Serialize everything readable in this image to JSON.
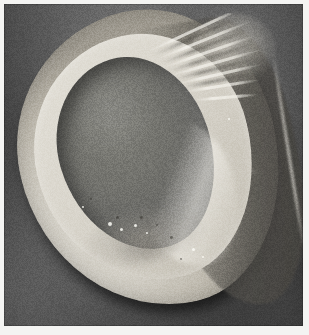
{
  "figure": {
    "domain": "Natural-Image",
    "kind": "grayscale-micrograph",
    "caption": "",
    "width_px": 309,
    "height_px": 335,
    "colorspace": "grayscale",
    "visible_text": [],
    "scale_bar": null,
    "labels": []
  },
  "plate": {
    "margin_px": 4,
    "background_tone": "#4d4d4d",
    "background_description": "mottled dark grey studio backdrop with faint vertical lighting streaks"
  },
  "specimen": {
    "name": "shell-valve",
    "description": "tilted ovate valve shown concave-side-up, bright granular calcareous rim surrounding a darker recessed interior cavity",
    "orientation_deg": -13,
    "regions": [
      {
        "name": "outer-rim",
        "tone": "#cdc9bf",
        "description": "broad bright granular shell margin"
      },
      {
        "name": "inner-cavity",
        "tone": "#6d6d68",
        "description": "dark recessed hollow interior of the valve"
      },
      {
        "name": "posterior-flank",
        "tone": "#5a5854",
        "description": "shadowed right-hand outer surface of the valve"
      },
      {
        "name": "dorsal-ridges",
        "tone": "#e8e5dd",
        "description": "lamellate ridged growth structure at the upper right (umbo region)"
      },
      {
        "name": "ventral-margin",
        "tone": "#d9d6cd",
        "description": "smooth bright lower edge with cast shadow beneath"
      }
    ],
    "accent_colors": {
      "highlight": "#e8e5dd",
      "midtone": "#b9b4a8",
      "shadow": "#3f3f3f",
      "cavity": "#6d6d68"
    }
  },
  "ridges": [
    {
      "left": 6,
      "top": 14,
      "width": 108,
      "rot": -16
    },
    {
      "left": 14,
      "top": 26,
      "width": 104,
      "rot": -13
    },
    {
      "left": 20,
      "top": 38,
      "width": 100,
      "rot": -10
    },
    {
      "left": 26,
      "top": 50,
      "width": 96,
      "rot": -7
    },
    {
      "left": 32,
      "top": 62,
      "width": 88,
      "rot": -4
    },
    {
      "left": 38,
      "top": 74,
      "width": 78,
      "rot": 0
    },
    {
      "left": 46,
      "top": 86,
      "width": 66,
      "rot": 4
    }
  ],
  "ridges_dark": [
    {
      "left": 10,
      "top": 20,
      "width": 104,
      "rot": -15
    },
    {
      "left": 18,
      "top": 32,
      "width": 100,
      "rot": -12
    },
    {
      "left": 24,
      "top": 44,
      "width": 96,
      "rot": -9
    },
    {
      "left": 30,
      "top": 56,
      "width": 90,
      "rot": -5
    },
    {
      "left": 36,
      "top": 68,
      "width": 82,
      "rot": -2
    }
  ],
  "specks": [
    {
      "left": 88,
      "top": 212,
      "size": 4
    },
    {
      "left": 100,
      "top": 218,
      "size": 3
    },
    {
      "left": 114,
      "top": 214,
      "size": 3
    },
    {
      "left": 126,
      "top": 222,
      "size": 2
    },
    {
      "left": 172,
      "top": 238,
      "size": 3
    },
    {
      "left": 182,
      "top": 246,
      "size": 2
    },
    {
      "left": 62,
      "top": 196,
      "size": 2
    },
    {
      "left": 208,
      "top": 108,
      "size": 2
    }
  ],
  "specks_dark": [
    {
      "left": 96,
      "top": 206,
      "size": 3
    },
    {
      "left": 120,
      "top": 206,
      "size": 3
    },
    {
      "left": 136,
      "top": 214,
      "size": 2
    },
    {
      "left": 150,
      "top": 226,
      "size": 3
    },
    {
      "left": 70,
      "top": 188,
      "size": 2
    },
    {
      "left": 160,
      "top": 248,
      "size": 2
    }
  ]
}
